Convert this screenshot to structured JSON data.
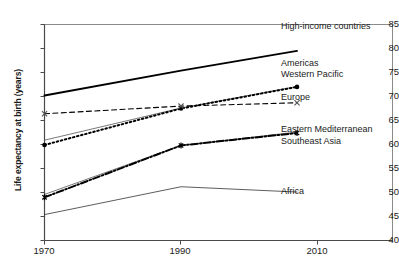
{
  "chart_data": {
    "type": "line",
    "title": "",
    "xlabel": "",
    "ylabel": "Life expectancy at birth (years)",
    "xlim": [
      1970,
      2010
    ],
    "ylim": [
      40,
      85
    ],
    "yticks": [
      40,
      45,
      50,
      55,
      60,
      65,
      70,
      75,
      80,
      85
    ],
    "xticks": [
      1970,
      1990,
      2010
    ],
    "grid": false,
    "legend_position": "right-inline",
    "x": [
      1970,
      1990,
      2007
    ],
    "series": [
      {
        "name": "High-income countries",
        "label": "High-income countries",
        "style": "solid-thick",
        "marker": "none",
        "color": "#000000",
        "values": [
          70.2,
          75.4,
          79.5
        ]
      },
      {
        "name": "Americas",
        "label": "Americas",
        "style": "solid-thin",
        "marker": "none",
        "color": "#555555",
        "values": [
          60.9,
          67.6,
          72.1
        ]
      },
      {
        "name": "Western Pacific",
        "label": "Western Pacific",
        "style": "dotted",
        "marker": "circle",
        "color": "#000000",
        "values": [
          59.9,
          67.5,
          72.0
        ]
      },
      {
        "name": "Europe",
        "label": "Europe",
        "style": "dashed",
        "marker": "cross",
        "color": "#000000",
        "values": [
          66.4,
          68.0,
          68.7
        ]
      },
      {
        "name": "Eastern Mediterranean",
        "label": "Eastern Mediterranean",
        "style": "solid-thin",
        "marker": "none",
        "color": "#555555",
        "values": [
          49.6,
          59.8,
          62.6
        ]
      },
      {
        "name": "Southeast Asia",
        "label": "Southeast Asia",
        "style": "dash-dot-thick",
        "marker": "asterisk",
        "color": "#000000",
        "values": [
          49.0,
          59.8,
          62.4
        ]
      },
      {
        "name": "Africa",
        "label": "Africa",
        "style": "solid-thin",
        "marker": "none",
        "color": "#333333",
        "values": [
          45.4,
          51.2,
          50.1
        ]
      }
    ],
    "series_labels": [
      {
        "text": "High-income countries",
        "x": 281,
        "y": 26
      },
      {
        "text": "Americas",
        "x": 281,
        "y": 62
      },
      {
        "text": "Western Pacific",
        "x": 281,
        "y": 72
      },
      {
        "text": "Europe",
        "x": 281,
        "y": 95
      },
      {
        "text": "Eastern Mediterranean",
        "x": 281,
        "y": 127
      },
      {
        "text": "Southeast Asia",
        "x": 281,
        "y": 139
      },
      {
        "text": "Africa",
        "x": 281,
        "y": 189
      }
    ],
    "ytick_labels": [
      "40",
      "45",
      "50",
      "55",
      "60",
      "65",
      "70",
      "75",
      "80",
      "85"
    ],
    "xtick_labels": [
      "1970",
      "1990",
      "2010"
    ]
  }
}
